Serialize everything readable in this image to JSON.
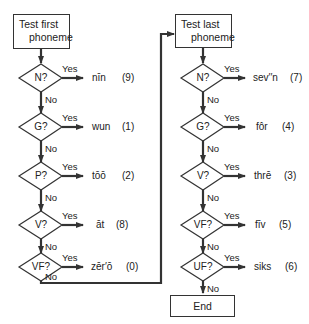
{
  "left_column": {
    "start_box": {
      "line1": "Test first",
      "line2": "phoneme"
    },
    "decisions": [
      {
        "label": "N?",
        "yes": "Yes",
        "no": "No",
        "word": "nīn",
        "number": "(9)"
      },
      {
        "label": "G?",
        "yes": "Yes",
        "no": "No",
        "word": "wun",
        "number": "(1)"
      },
      {
        "label": "P?",
        "yes": "Yes",
        "no": "No",
        "word": "tōō",
        "number": "(2)"
      },
      {
        "label": "V?",
        "yes": "Yes",
        "no": "No",
        "word": "āt",
        "number": "(8)"
      },
      {
        "label": "VF?",
        "yes": "Yes",
        "no": "No",
        "word": "zēr′ō",
        "number": "(0)"
      }
    ]
  },
  "right_column": {
    "start_box": {
      "line1": "Test last",
      "line2": "phoneme"
    },
    "decisions": [
      {
        "label": "N?",
        "yes": "Yes",
        "no": "No",
        "word": "sev′′n",
        "number": "(7)"
      },
      {
        "label": "G?",
        "yes": "Yes",
        "no": "No",
        "word": "fôr",
        "number": "(4)"
      },
      {
        "label": "V?",
        "yes": "Yes",
        "no": "No",
        "word": "thrē",
        "number": "(3)"
      },
      {
        "label": "VF?",
        "yes": "Yes",
        "no": "No",
        "word": "fīv",
        "number": "(5)"
      },
      {
        "label": "UF?",
        "yes": "Yes",
        "no": "No",
        "word": "siks",
        "number": "(6)"
      }
    ],
    "end_box": {
      "label": "End"
    }
  },
  "colors": {
    "line": "#333333",
    "background": "#ffffff",
    "text": "#222222"
  }
}
